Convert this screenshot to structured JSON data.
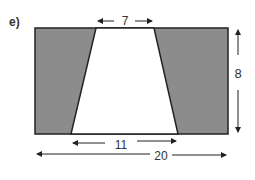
{
  "question_label": "e)",
  "shape": {
    "outer": "rectangle",
    "inner": "trapezoid (unshaded)",
    "shaded_color": "#8c8c8c",
    "line_color": "#222222"
  },
  "dimensions": {
    "top_width": "7",
    "bottom_width": "11",
    "total_width": "20",
    "height": "8"
  }
}
